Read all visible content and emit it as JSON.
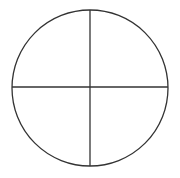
{
  "diagram": {
    "type": "circle-divided-into-quadrants",
    "quadrant_count": 4,
    "stroke_color": "#333333",
    "fill_color": "#ffffff",
    "elements": [
      {
        "name": "outer-circle",
        "kind": "circle"
      },
      {
        "name": "vertical-divider",
        "kind": "line"
      },
      {
        "name": "horizontal-divider",
        "kind": "line"
      }
    ]
  }
}
